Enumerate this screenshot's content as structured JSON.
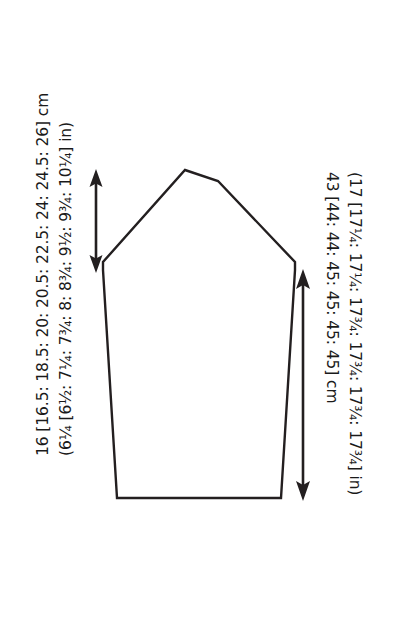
{
  "document": {
    "title": "Garment Piece Schematic",
    "background_color": "#ffffff",
    "line_color": "#231f20",
    "text_color": "#1a1a1a"
  },
  "diagram": {
    "name": "sleeve-cap-and-body-schematic",
    "shape_description": "Pentagonal garment panel with peaked top, sloping raglan/cap edges, underarm notches and straight side seams down to a flat hem",
    "outline_points": "117,498 103,270 103,262 185,170 218,181 295,262 295,270 281,498",
    "vertices": [
      {
        "name": "hem-left-corner",
        "x": 117,
        "y": 498
      },
      {
        "name": "underarm-left-notch-bottom",
        "x": 103,
        "y": 270
      },
      {
        "name": "underarm-left-notch-top",
        "x": 103,
        "y": 262
      },
      {
        "name": "cap-peak-left",
        "x": 185,
        "y": 170
      },
      {
        "name": "cap-peak-right",
        "x": 218,
        "y": 181
      },
      {
        "name": "underarm-right-notch-top",
        "x": 295,
        "y": 262
      },
      {
        "name": "underarm-right-notch-bottom",
        "x": 295,
        "y": 270
      },
      {
        "name": "hem-right-corner",
        "x": 281,
        "y": 498
      }
    ]
  },
  "measurements": {
    "cap_height": {
      "id": "left-dimension",
      "arrow": {
        "name": "cap-height-arrow",
        "orientation": "vertical",
        "double_headed": true,
        "x": 96,
        "y_top": 172,
        "y_bottom": 270
      },
      "cm_line": "16 [16.5: 18.5: 20: 20.5: 22.5: 24: 24.5: 26] cm",
      "in_line": "(6¼ [6½: 7¼: 7¾: 8: 8¾: 9½: 9¾: 10¼] in)",
      "cm_values": [
        16,
        16.5,
        18.5,
        20,
        20.5,
        22.5,
        24,
        24.5,
        26
      ],
      "in_values": [
        "6¼",
        "6½",
        "7¼",
        "7¾",
        "8",
        "8¾",
        "9½",
        "9¾",
        "10¼"
      ],
      "unit_cm": "cm",
      "unit_in": "in"
    },
    "body_length": {
      "id": "right-dimension",
      "arrow": {
        "name": "body-length-arrow",
        "orientation": "vertical",
        "double_headed": true,
        "x": 303,
        "y_top": 272,
        "y_bottom": 498
      },
      "cm_line": "43 [44: 44: 45: 45: 45: 45] cm",
      "in_line": "(17 [17¼: 17¼: 17¾: 17¾: 17¾: 17¾] in)",
      "cm_values": [
        43,
        44,
        44,
        45,
        45,
        45,
        45
      ],
      "in_values": [
        "17",
        "17¼",
        "17¼",
        "17¾",
        "17¾",
        "17¾",
        "17¾"
      ],
      "unit_cm": "cm",
      "unit_in": "in"
    }
  }
}
